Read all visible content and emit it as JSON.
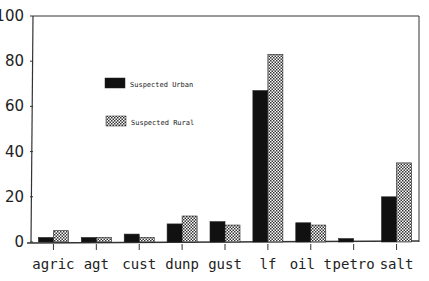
{
  "chart_data": {
    "type": "bar",
    "title": "",
    "xlabel": "",
    "ylabel": "",
    "ylim": [
      0,
      100
    ],
    "yticks": [
      0,
      20,
      40,
      60,
      80,
      100
    ],
    "grid": false,
    "legend_position": "inside-upper-left-center",
    "categories": [
      "agric",
      "agt",
      "cust",
      "dunp",
      "gust",
      "lf",
      "oil t",
      "petro",
      "salt"
    ],
    "series": [
      {
        "name": "Suspected Urban",
        "style": "solid-black",
        "values": [
          2,
          2,
          3.5,
          8,
          9,
          67,
          8.5,
          1.5,
          20
        ]
      },
      {
        "name": "Suspected Rural",
        "style": "checkered",
        "values": [
          5,
          2,
          2,
          11.5,
          7.5,
          83,
          7.5,
          0,
          35
        ]
      }
    ]
  },
  "colors": {
    "urban": "#111111",
    "rural_pattern": "#333333",
    "axis": "#333333"
  }
}
